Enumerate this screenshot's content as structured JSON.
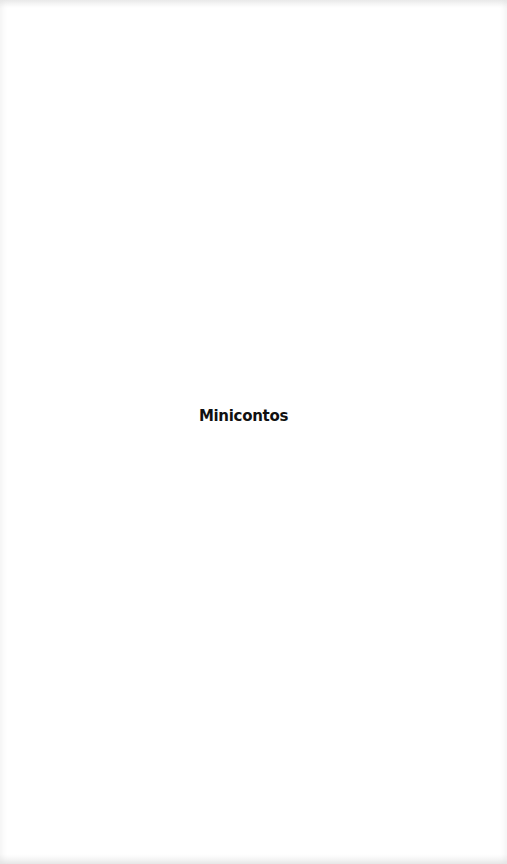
{
  "document": {
    "title": "Minicontos"
  },
  "colors": {
    "background": "#ffffff",
    "text": "#111111"
  }
}
